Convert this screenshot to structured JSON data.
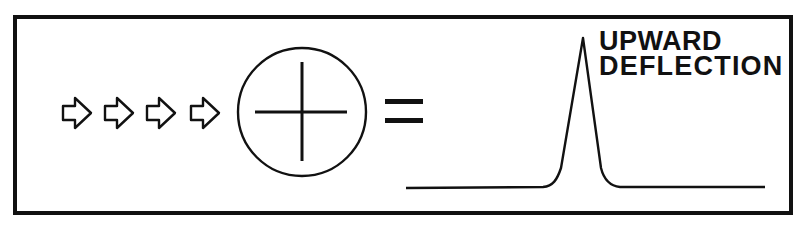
{
  "diagram": {
    "arrows": {
      "count": 4,
      "direction": "right",
      "icon": "outline-arrow-right"
    },
    "symbol": {
      "icon": "circled-plus",
      "meaning": "positive"
    },
    "operator": "=",
    "waveform": {
      "type": "peak",
      "direction": "upward"
    },
    "label_lines": [
      "UPWARD",
      "DEFLECTION"
    ],
    "colors": {
      "stroke": "#111111",
      "background": "#ffffff"
    }
  }
}
